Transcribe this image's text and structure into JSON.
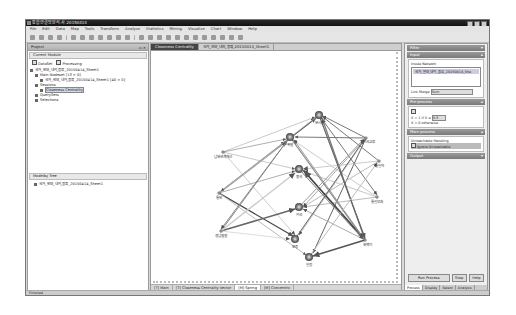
{
  "window": {
    "title": "통합연결망분석.사.20150414",
    "controls": [
      "minimize",
      "maximize",
      "close"
    ]
  },
  "menu": [
    "File",
    "Edit",
    "Data",
    "Map",
    "Tools",
    "Transform",
    "Analyze",
    "Statistics",
    "Mining",
    "Visualize",
    "Chart",
    "Window",
    "Help"
  ],
  "left_panel": {
    "tab": "Project",
    "current_module": "Current Module",
    "checkboxes": [
      {
        "label": "DataSet",
        "checked": true
      },
      {
        "label": "Processing",
        "checked": true
      }
    ],
    "tree": [
      "국가_안보_내외_종류_20150414_Sheet1",
      "Main Nodeset [13 × 0]",
      "국가_안보_내외_종류_20150414_Sheet1 [40 × 0]",
      "Sessions",
      "Closeness Centrality",
      "QuerySets",
      "Selections"
    ],
    "module_tree_title": "Modelby Tree",
    "module_tree_item": "국가_안보_내외_종류_20150414_Sheet1"
  },
  "editor": {
    "tabs": [
      "Closeness Centrality",
      "국가_안보_내외_종류_20150414_Sheet1"
    ],
    "active_tab": 0,
    "bottom_tabs": [
      "[T] Main",
      "[T] Closeness Centrality Vector",
      "[M] Spring",
      "[M] Concentric"
    ],
    "active_bottom_tab": 2
  },
  "graph": {
    "nodes": [
      {
        "id": "n1",
        "label": "분시장",
        "x": 292,
        "y": 94,
        "size": "large"
      },
      {
        "id": "n2",
        "label": "폭발",
        "x": 263,
        "y": 116,
        "size": "large"
      },
      {
        "id": "n3",
        "label": "중국",
        "x": 272,
        "y": 148,
        "size": "large"
      },
      {
        "id": "n4",
        "label": "외국",
        "x": 272,
        "y": 186,
        "size": "large"
      },
      {
        "id": "n5",
        "label": "문종",
        "x": 268,
        "y": 218,
        "size": "large"
      },
      {
        "id": "n6",
        "label": "일정",
        "x": 282,
        "y": 236,
        "size": "large"
      },
      {
        "id": "n7",
        "label": "남북관계개선",
        "x": 196,
        "y": 131,
        "size": "small"
      },
      {
        "id": "n8",
        "label": "통안",
        "x": 192,
        "y": 172,
        "size": "small"
      },
      {
        "id": "n9",
        "label": "경남협절",
        "x": 194,
        "y": 210,
        "size": "small"
      },
      {
        "id": "n10",
        "label": "외국교류",
        "x": 339,
        "y": 117,
        "size": "small"
      },
      {
        "id": "n11",
        "label": "통일차",
        "x": 352,
        "y": 140,
        "size": "small"
      },
      {
        "id": "n12",
        "label": "통일부처",
        "x": 350,
        "y": 176,
        "size": "small"
      },
      {
        "id": "n13",
        "label": "북핵이",
        "x": 338,
        "y": 219,
        "size": "small"
      }
    ]
  },
  "right_panel": {
    "sections": {
      "filter": "Filter",
      "input": "Input",
      "input_group": "Inside Network",
      "input_item": "국가_안보_내외_종류_20150414_She",
      "link_merge_label": "Link Merge",
      "link_merge_value": "Sum",
      "preprocess": "Pre-process",
      "formula1": "X = 1 if X ≥",
      "formula_value": "0.5",
      "formula2": "X = 0 otherwise",
      "main_process": "Main process",
      "unreachable_group": "Unreachable Handling",
      "unreachable_option": "Ignore Unreachable",
      "output": "Output"
    },
    "buttons": [
      "Run Process",
      "Stop",
      "Help"
    ],
    "tabs": [
      "Process",
      "Display",
      "Select",
      "Analysis"
    ],
    "active_tab": 0
  },
  "statusbar": {
    "text": "Finished"
  }
}
